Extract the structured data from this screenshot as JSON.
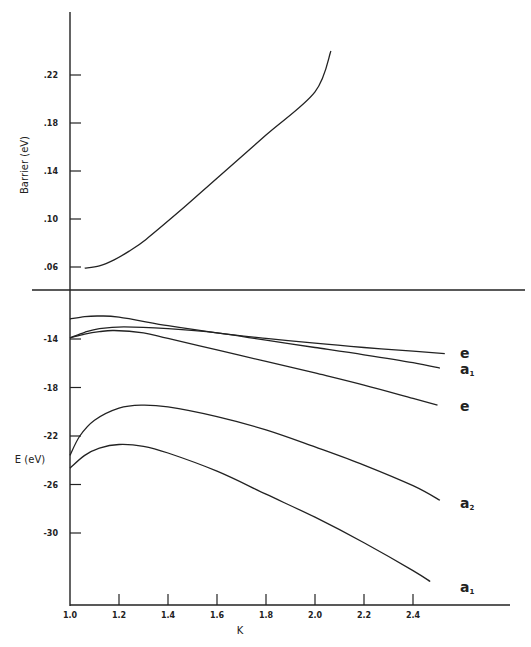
{
  "chart_data": [
    {
      "type": "line",
      "panel": "upper",
      "title": "",
      "xlabel": "K",
      "ylabel": "Barrier (eV)",
      "xlim": [
        1.0,
        2.6
      ],
      "ylim": [
        0.04,
        0.26
      ],
      "yticks": [
        0.06,
        0.1,
        0.14,
        0.18,
        0.22
      ],
      "ytick_labels": [
        ".06",
        ".10",
        ".14",
        ".18",
        ".22"
      ],
      "grid": false,
      "series": [
        {
          "name": "Barrier",
          "x": [
            1.06,
            1.12,
            1.18,
            1.24,
            1.31,
            1.45,
            1.6,
            1.8,
            2.0,
            2.065
          ],
          "y": [
            0.059,
            0.061,
            0.066,
            0.073,
            0.083,
            0.107,
            0.134,
            0.17,
            0.206,
            0.24
          ]
        }
      ]
    },
    {
      "type": "line",
      "panel": "lower",
      "title": "",
      "xlabel": "K",
      "ylabel": "E (eV)",
      "xlim": [
        1.0,
        2.6
      ],
      "ylim": [
        -35.5,
        -10.0
      ],
      "xticks": [
        1.0,
        1.2,
        1.4,
        1.6,
        1.8,
        2.0,
        2.2,
        2.4
      ],
      "xtick_labels": [
        "1.0",
        "1.2",
        "1.4",
        "1.6",
        "1.8",
        "2.0",
        "2.2",
        "2.4"
      ],
      "yticks": [
        -14,
        -18,
        -22,
        -26,
        -30
      ],
      "ytick_labels": [
        "-14",
        "-18",
        "-22",
        "-26",
        "-30"
      ],
      "grid": false,
      "series": [
        {
          "name": "e",
          "x": [
            1.0,
            1.06,
            1.12,
            1.2,
            1.4,
            1.6,
            1.8,
            2.0,
            2.2,
            2.4,
            2.53
          ],
          "y": [
            -12.35,
            -12.15,
            -12.1,
            -12.2,
            -12.9,
            -13.5,
            -13.95,
            -14.35,
            -14.7,
            -15.0,
            -15.2
          ]
        },
        {
          "name": "a1",
          "x": [
            1.0,
            1.06,
            1.12,
            1.22,
            1.4,
            1.6,
            1.8,
            2.0,
            2.2,
            2.4,
            2.51
          ],
          "y": [
            -13.9,
            -13.45,
            -13.15,
            -13.0,
            -13.15,
            -13.5,
            -14.1,
            -14.7,
            -15.3,
            -15.95,
            -16.4
          ]
        },
        {
          "name": "e",
          "x": [
            1.0,
            1.06,
            1.12,
            1.18,
            1.3,
            1.4,
            1.6,
            1.8,
            2.0,
            2.2,
            2.4,
            2.5
          ],
          "y": [
            -13.9,
            -13.6,
            -13.4,
            -13.3,
            -13.5,
            -13.95,
            -14.9,
            -15.85,
            -16.8,
            -17.8,
            -18.9,
            -19.45
          ]
        },
        {
          "name": "a2",
          "x": [
            1.0,
            1.04,
            1.1,
            1.2,
            1.29,
            1.4,
            1.6,
            1.8,
            2.0,
            2.2,
            2.4,
            2.51
          ],
          "y": [
            -23.6,
            -22.0,
            -20.7,
            -19.7,
            -19.45,
            -19.6,
            -20.4,
            -21.5,
            -22.9,
            -24.4,
            -26.1,
            -27.3
          ]
        },
        {
          "name": "a1",
          "x": [
            1.0,
            1.06,
            1.12,
            1.2,
            1.3,
            1.4,
            1.6,
            1.8,
            2.0,
            2.2,
            2.4,
            2.47
          ],
          "y": [
            -24.65,
            -23.6,
            -23.0,
            -22.7,
            -22.85,
            -23.4,
            -24.9,
            -26.8,
            -28.7,
            -30.8,
            -33.1,
            -34.0
          ]
        }
      ],
      "curve_labels": [
        {
          "text": "e",
          "sub": ""
        },
        {
          "text": "a",
          "sub": "1"
        },
        {
          "text": "e",
          "sub": ""
        },
        {
          "text": "a",
          "sub": "2"
        },
        {
          "text": "a",
          "sub": "1"
        }
      ]
    }
  ],
  "axes": {
    "upper_ylabel": "Barrier (eV)",
    "lower_ylabel": "E (eV)",
    "xlabel": "K"
  }
}
